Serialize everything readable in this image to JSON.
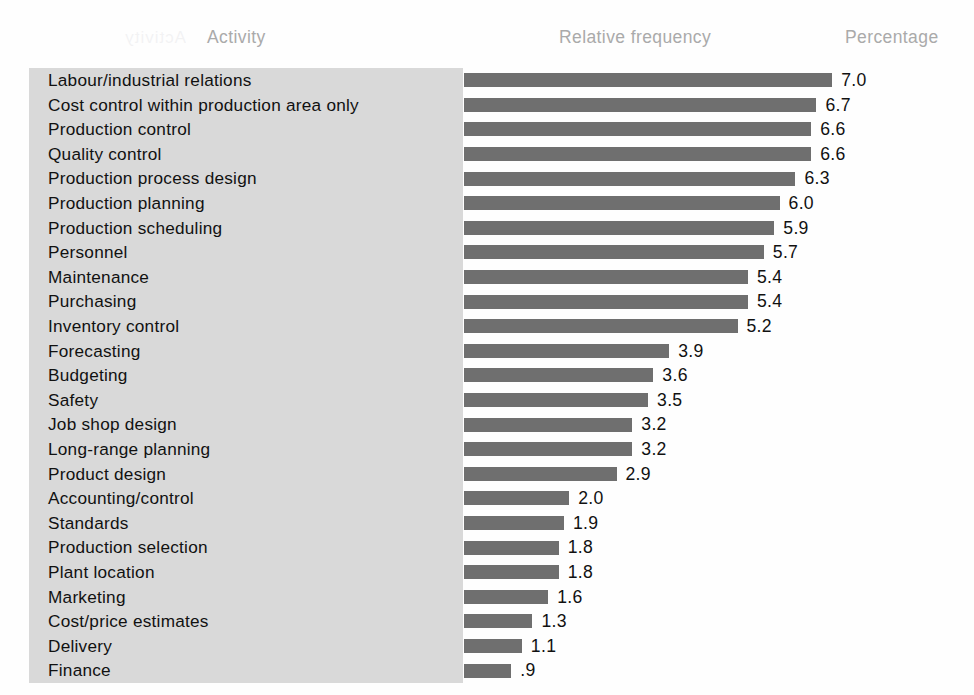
{
  "headers": {
    "activity": "Activity",
    "relative_frequency": "Relative frequency",
    "percentage": "Percentage"
  },
  "colors": {
    "bar": "#6f6f6f",
    "label_panel": "#d9d9d9",
    "header_text": "#aaaaaa",
    "body_text": "#111111",
    "page_background": "#ffffff"
  },
  "artifacts": {
    "bleed_top": "Activity",
    "bleed_bottom": "Finance"
  },
  "chart_data": {
    "type": "bar",
    "orientation": "horizontal",
    "title": "",
    "xlabel": "Relative frequency",
    "ylabel": "Activity",
    "grid": false,
    "legend": null,
    "xlim": [
      0,
      7.0
    ],
    "value_format": "one-decimal, leading zero omitted below 1.0",
    "categories": [
      "Labour/industrial relations",
      "Cost control within production area only",
      "Production control",
      "Quality control",
      "Production process design",
      "Production planning",
      "Production scheduling",
      "Personnel",
      "Maintenance",
      "Purchasing",
      "Inventory control",
      "Forecasting",
      "Budgeting",
      "Safety",
      "Job shop design",
      "Long-range planning",
      "Product design",
      "Accounting/control",
      "Standards",
      "Production selection",
      "Plant location",
      "Marketing",
      "Cost/price estimates",
      "Delivery",
      "Finance"
    ],
    "values": [
      7.0,
      6.7,
      6.6,
      6.6,
      6.3,
      6.0,
      5.9,
      5.7,
      5.4,
      5.4,
      5.2,
      3.9,
      3.6,
      3.5,
      3.2,
      3.2,
      2.9,
      2.0,
      1.9,
      1.8,
      1.8,
      1.6,
      1.3,
      1.1,
      0.9
    ],
    "value_labels": [
      "7.0",
      "6.7",
      "6.6",
      "6.6",
      "6.3",
      "6.0",
      "5.9",
      "5.7",
      "5.4",
      "5.4",
      "5.2",
      "3.9",
      "3.6",
      "3.5",
      "3.2",
      "3.2",
      "2.9",
      "2.0",
      "1.9",
      "1.8",
      "1.8",
      "1.6",
      "1.3",
      "1.1",
      ".9"
    ]
  }
}
